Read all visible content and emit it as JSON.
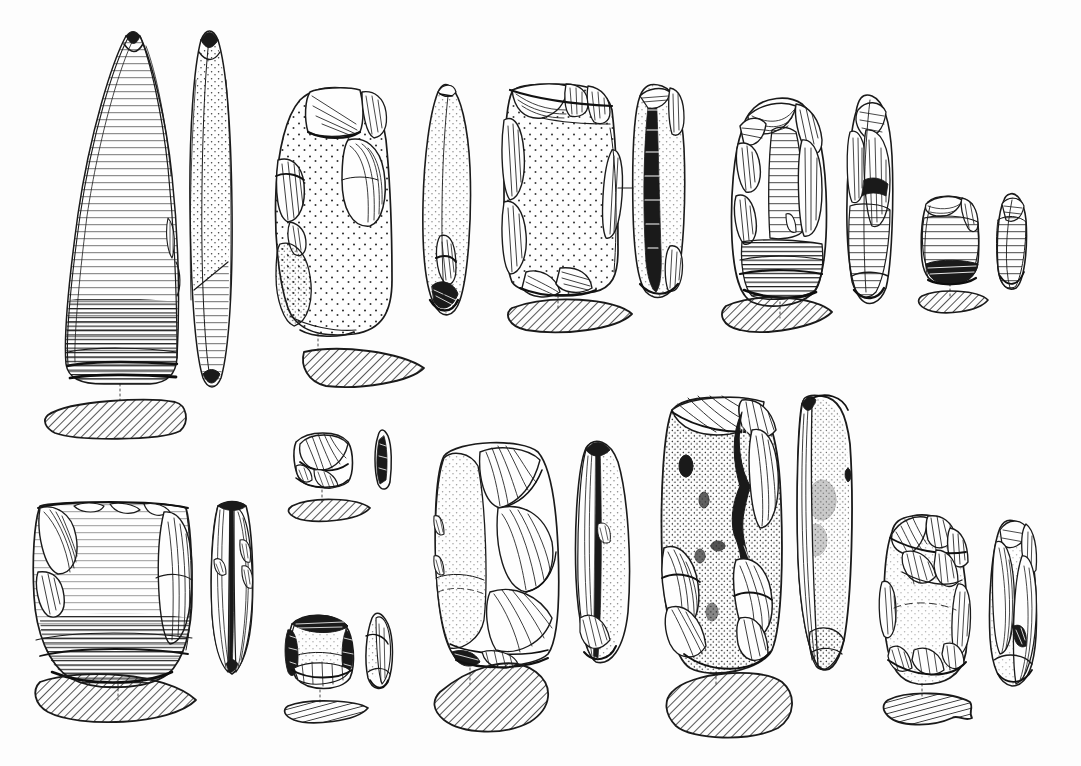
{
  "plate": {
    "title": "Lithic artefact plate",
    "kind": "archaeological-illustration",
    "medium": "pen-and-ink line drawing",
    "background_color": "#fdfdfd",
    "ink_color": "#1a1a1a",
    "width_px": 1081,
    "height_px": 766,
    "rows": 2,
    "artifact_count": 11,
    "labels_present": "none",
    "scale_bar_present": "none",
    "caption_text": "",
    "conventions": {
      "views_per_artifact": "face view, side profile, hatched cross-section",
      "cross_section_fill": "diagonal hatching",
      "cortex_texture": "stipple dots",
      "flake_scar_texture": "ripple hatch lines",
      "connector_style": "dotted leader line from tool to section"
    }
  },
  "rows": [
    {
      "name": "upper-row",
      "artifacts": [
        {
          "id": "a1",
          "name": "polished-stone-adze",
          "type": "ground and polished adze",
          "views": [
            "face",
            "profile",
            "section"
          ],
          "section_shape": "plano-convex lenticular",
          "surface": "ground with striations",
          "row": 1,
          "col": 1
        },
        {
          "id": "a2",
          "name": "cortical-flaked-core-tool",
          "type": "flaked cobble tool",
          "views": [
            "face",
            "profile",
            "section"
          ],
          "section_shape": "plano-convex",
          "surface": "stippled cortex with marginal flake scars",
          "row": 1,
          "col": 2
        },
        {
          "id": "a3",
          "name": "rectangular-flaked-adze",
          "type": "flaked adze preform",
          "views": [
            "face",
            "profile",
            "section"
          ],
          "section_shape": "low plano-convex",
          "surface": "stippled cortex, retouched edges",
          "row": 1,
          "col": 3
        },
        {
          "id": "a4",
          "name": "oval-flaked-adze",
          "type": "bifacially flaked adze",
          "views": [
            "face",
            "profile",
            "section"
          ],
          "section_shape": "lenticular",
          "surface": "flake scars with ground bevel",
          "row": 1,
          "col": 4
        },
        {
          "id": "a5",
          "name": "small-flaked-chisel",
          "type": "small chisel / gouge",
          "views": [
            "face",
            "profile",
            "section"
          ],
          "section_shape": "thin plano-convex",
          "surface": "flake scars, polished bit",
          "row": 1,
          "col": 5
        }
      ]
    },
    {
      "name": "lower-row",
      "artifacts": [
        {
          "id": "b1",
          "name": "broad-ground-adze-butt",
          "type": "broad ground adze, butt fragment",
          "views": [
            "face",
            "profile",
            "section"
          ],
          "section_shape": "wide lenticular",
          "surface": "ground with fine striations",
          "row": 2,
          "col": 1
        },
        {
          "id": "b2",
          "name": "small-flaked-scraper-upper",
          "type": "small scraper",
          "views": [
            "face",
            "profile",
            "section"
          ],
          "section_shape": "thin elongate",
          "surface": "steep retouch",
          "row": 2,
          "col": 2
        },
        {
          "id": "b3",
          "name": "small-flaked-scraper-lower",
          "type": "small triangular scraper",
          "views": [
            "face",
            "profile",
            "section"
          ],
          "section_shape": "thin elongate",
          "surface": "marginal retouch",
          "row": 2,
          "col": 3
        },
        {
          "id": "b4",
          "name": "flaked-adze-rectangular",
          "type": "flaked adze",
          "views": [
            "face",
            "profile",
            "section"
          ],
          "section_shape": "angular rhomboid",
          "surface": "stipple with long flake scars",
          "row": 2,
          "col": 4
        },
        {
          "id": "b5",
          "name": "large-cortical-adze",
          "type": "large cortical adze",
          "views": [
            "face",
            "profile",
            "section"
          ],
          "section_shape": "sub-rectangular rounded",
          "surface": "heavily stippled cortex with inclusions",
          "row": 2,
          "col": 5
        },
        {
          "id": "b6",
          "name": "tapered-flaked-adze",
          "type": "tapered flaked adze",
          "views": [
            "face",
            "profile",
            "section"
          ],
          "section_shape": "trapezoidal with spur",
          "surface": "overlapping flake scars",
          "row": 2,
          "col": 6
        }
      ]
    }
  ]
}
